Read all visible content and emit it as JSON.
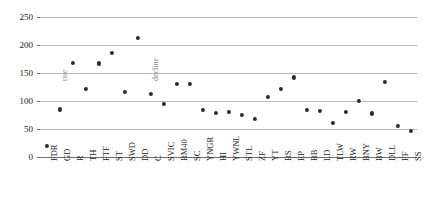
{
  "chart_data": {
    "type": "scatter",
    "title": "",
    "xlabel": "",
    "ylabel": "",
    "ylim": [
      0,
      250
    ],
    "yticks": [
      0,
      50,
      100,
      150,
      200,
      250
    ],
    "grid": true,
    "legend": "none",
    "categories": [
      "FDR",
      "GD",
      "R",
      "TH",
      "FTF",
      "ST",
      "SWD",
      "DD",
      "C",
      "SVIC",
      "BM40",
      "SC",
      "YNGR",
      "HI",
      "YWNL",
      "STL",
      "ZF",
      "YT",
      "BS",
      "EP",
      "BB",
      "LD",
      "TLW",
      "RW",
      "BNY",
      "BW",
      "DLL",
      "FF",
      "SS"
    ],
    "values": [
      20,
      85,
      168,
      122,
      167,
      186,
      116,
      212,
      112,
      95,
      131,
      131,
      84,
      79,
      81,
      75,
      68,
      108,
      122,
      142,
      84,
      83,
      61,
      80,
      100,
      78,
      134,
      56,
      46
    ],
    "annotations": [
      {
        "text": "rise",
        "category_index": 1,
        "value": 135
      },
      {
        "text": "decline",
        "category_index": 8,
        "value": 135
      }
    ]
  }
}
